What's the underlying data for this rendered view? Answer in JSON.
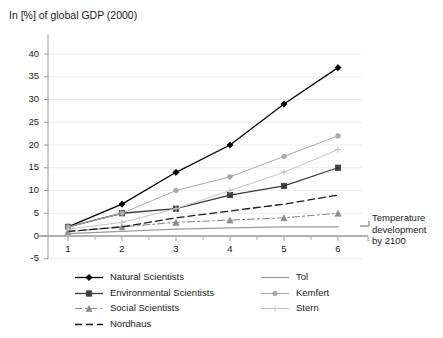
{
  "chart_data": {
    "type": "line",
    "title": "In [%] of global GDP (2000)",
    "xlabel": "Temperature development by 2100",
    "ylabel": "In [%] of global GDP (2000)",
    "x": [
      1,
      2,
      3,
      4,
      5,
      6
    ],
    "xticklabels": [
      "1",
      "2",
      "3",
      "4",
      "5",
      "6"
    ],
    "yticklabels": [
      "40",
      "35",
      "30",
      "25",
      "20",
      "15",
      "10",
      "5",
      "0",
      "-5"
    ],
    "xlim": [
      0.6,
      6.45
    ],
    "ylim": [
      -5,
      40
    ],
    "grid": true,
    "legend_position": "bottom",
    "series": [
      {
        "name": "Natural Scientists",
        "values": [
          2,
          7,
          14,
          20,
          29,
          37
        ],
        "color": "#000000",
        "marker": "diamond",
        "dash": "solid",
        "width": 1.3
      },
      {
        "name": "Environmental Scientists",
        "values": [
          2,
          5,
          6,
          9,
          11,
          15
        ],
        "color": "#3c3c3c",
        "marker": "square",
        "dash": "solid",
        "width": 1.3
      },
      {
        "name": "Social Scientists",
        "values": [
          1,
          2,
          3,
          3.5,
          4,
          5
        ],
        "color": "#8c8c8c",
        "marker": "triangle",
        "dash": "dashdot",
        "width": 1.1
      },
      {
        "name": "Nordhaus",
        "values": [
          1,
          2,
          4,
          5.5,
          7,
          9
        ],
        "color": "#1a1a1a",
        "marker": "none",
        "dash": "dashed",
        "width": 1.3
      },
      {
        "name": "Tol",
        "values": [
          0.5,
          1,
          1.5,
          1.8,
          2,
          2
        ],
        "color": "#9a9a9a",
        "marker": "none",
        "dash": "solid",
        "width": 1.3
      },
      {
        "name": "Kemfert",
        "values": [
          2,
          5,
          10,
          13,
          17.5,
          22
        ],
        "color": "#a8a8a8",
        "marker": "dot",
        "dash": "solid",
        "width": 1.0
      },
      {
        "name": "Stern",
        "values": [
          1.5,
          3,
          6,
          10,
          14,
          19
        ],
        "color": "#c4c4c4",
        "marker": "plus",
        "dash": "solid",
        "width": 1.0
      }
    ]
  },
  "chart": {
    "title": "In [%] of global GDP (2000)",
    "axis_caption_line1": "Temperature",
    "axis_caption_line2": "development",
    "axis_caption_line3": "by 2100"
  },
  "legend": {
    "left_column": [
      {
        "label": "Natural Scientists"
      },
      {
        "label": "Environmental Scientists"
      },
      {
        "label": "Social Scientists"
      },
      {
        "label": "Nordhaus"
      }
    ],
    "right_column": [
      {
        "label": "Tol"
      },
      {
        "label": "Kemfert"
      },
      {
        "label": "Stern"
      }
    ]
  }
}
